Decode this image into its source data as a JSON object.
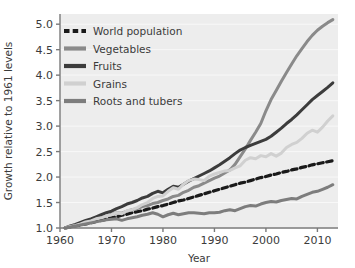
{
  "chart_data": {
    "type": "line",
    "title": "",
    "xlabel": "Year",
    "ylabel": "Growth relative to 1961 levels",
    "xlim": [
      1960,
      2014
    ],
    "ylim": [
      1.0,
      5.2
    ],
    "grid": true,
    "legend_position": "top-left",
    "x_ticks": [
      "1960",
      "1970",
      "1980",
      "1990",
      "2000",
      "2010"
    ],
    "x_tick_values": [
      1960,
      1970,
      1980,
      1990,
      2000,
      2010
    ],
    "y_ticks": [
      "1.0",
      "1.5",
      "2.0",
      "2.5",
      "3.0",
      "3.5",
      "4.0",
      "4.5",
      "5.0"
    ],
    "y_tick_values": [
      1.0,
      1.5,
      2.0,
      2.5,
      3.0,
      3.5,
      4.0,
      4.5,
      5.0
    ],
    "x": [
      1961,
      1962,
      1963,
      1964,
      1965,
      1966,
      1967,
      1968,
      1969,
      1970,
      1971,
      1972,
      1973,
      1974,
      1975,
      1976,
      1977,
      1978,
      1979,
      1980,
      1981,
      1982,
      1983,
      1984,
      1985,
      1986,
      1987,
      1988,
      1989,
      1990,
      1991,
      1992,
      1993,
      1994,
      1995,
      1996,
      1997,
      1998,
      1999,
      2000,
      2001,
      2002,
      2003,
      2004,
      2005,
      2006,
      2007,
      2008,
      2009,
      2010,
      2011,
      2012,
      2013
    ],
    "series": [
      {
        "name": "World population",
        "color": "#1a1a1a",
        "style": "dashed",
        "width": 3.2,
        "values": [
          1.0,
          1.02,
          1.04,
          1.06,
          1.08,
          1.1,
          1.13,
          1.15,
          1.17,
          1.2,
          1.22,
          1.25,
          1.27,
          1.3,
          1.32,
          1.34,
          1.37,
          1.39,
          1.42,
          1.44,
          1.47,
          1.5,
          1.53,
          1.55,
          1.58,
          1.61,
          1.64,
          1.67,
          1.7,
          1.73,
          1.76,
          1.79,
          1.82,
          1.85,
          1.88,
          1.9,
          1.93,
          1.96,
          1.99,
          2.01,
          2.04,
          2.06,
          2.09,
          2.11,
          2.14,
          2.16,
          2.19,
          2.21,
          2.24,
          2.26,
          2.28,
          2.3,
          2.32
        ]
      },
      {
        "name": "Vegetables",
        "color": "#8a8a8a",
        "style": "solid",
        "width": 3.0,
        "values": [
          1.0,
          1.03,
          1.05,
          1.09,
          1.12,
          1.14,
          1.18,
          1.21,
          1.24,
          1.27,
          1.3,
          1.29,
          1.33,
          1.36,
          1.38,
          1.42,
          1.44,
          1.48,
          1.5,
          1.54,
          1.57,
          1.62,
          1.64,
          1.7,
          1.74,
          1.8,
          1.83,
          1.88,
          1.93,
          1.98,
          2.02,
          2.08,
          2.14,
          2.25,
          2.4,
          2.55,
          2.72,
          2.88,
          3.05,
          3.3,
          3.52,
          3.7,
          3.88,
          4.05,
          4.22,
          4.38,
          4.52,
          4.66,
          4.78,
          4.88,
          4.96,
          5.03,
          5.09
        ]
      },
      {
        "name": "Fruits",
        "color": "#3c3c3c",
        "style": "solid",
        "width": 3.0,
        "values": [
          1.0,
          1.04,
          1.07,
          1.11,
          1.15,
          1.18,
          1.22,
          1.26,
          1.3,
          1.33,
          1.38,
          1.42,
          1.47,
          1.5,
          1.54,
          1.59,
          1.62,
          1.68,
          1.72,
          1.69,
          1.76,
          1.82,
          1.8,
          1.86,
          1.92,
          1.97,
          2.02,
          2.07,
          2.12,
          2.18,
          2.24,
          2.31,
          2.38,
          2.46,
          2.53,
          2.58,
          2.62,
          2.66,
          2.7,
          2.74,
          2.8,
          2.88,
          2.96,
          3.05,
          3.13,
          3.22,
          3.32,
          3.42,
          3.52,
          3.6,
          3.68,
          3.76,
          3.85
        ]
      },
      {
        "name": "Grains",
        "color": "#d0d0d0",
        "style": "solid",
        "width": 3.0,
        "values": [
          1.0,
          1.03,
          1.05,
          1.08,
          1.12,
          1.14,
          1.18,
          1.2,
          1.24,
          1.26,
          1.3,
          1.28,
          1.34,
          1.36,
          1.4,
          1.46,
          1.5,
          1.58,
          1.62,
          1.63,
          1.72,
          1.79,
          1.76,
          1.86,
          1.93,
          1.96,
          1.95,
          1.93,
          2.02,
          2.06,
          2.09,
          2.12,
          2.13,
          2.18,
          2.22,
          2.33,
          2.38,
          2.36,
          2.42,
          2.4,
          2.46,
          2.41,
          2.47,
          2.58,
          2.64,
          2.68,
          2.76,
          2.86,
          2.92,
          2.88,
          2.98,
          3.1,
          3.2
        ]
      },
      {
        "name": "Roots and tubers",
        "color": "#7d7d7d",
        "style": "solid",
        "width": 3.0,
        "values": [
          1.0,
          1.02,
          1.04,
          1.06,
          1.08,
          1.1,
          1.12,
          1.14,
          1.16,
          1.17,
          1.18,
          1.15,
          1.18,
          1.2,
          1.22,
          1.25,
          1.27,
          1.3,
          1.27,
          1.22,
          1.26,
          1.29,
          1.26,
          1.28,
          1.3,
          1.3,
          1.29,
          1.28,
          1.3,
          1.3,
          1.31,
          1.34,
          1.36,
          1.34,
          1.38,
          1.42,
          1.44,
          1.43,
          1.47,
          1.5,
          1.52,
          1.51,
          1.54,
          1.56,
          1.58,
          1.57,
          1.62,
          1.66,
          1.7,
          1.72,
          1.76,
          1.8,
          1.85
        ]
      }
    ],
    "legend_entries": [
      {
        "label": "World population",
        "color": "#1a1a1a",
        "style": "dashed"
      },
      {
        "label": "Vegetables",
        "color": "#8a8a8a",
        "style": "solid"
      },
      {
        "label": "Fruits",
        "color": "#3c3c3c",
        "style": "solid"
      },
      {
        "label": "Grains",
        "color": "#d0d0d0",
        "style": "solid"
      },
      {
        "label": "Roots and tubers",
        "color": "#7d7d7d",
        "style": "solid"
      }
    ]
  },
  "style": {
    "plot_background": "#ededed",
    "grid_color": "#f8f8f8",
    "axis_color": "#7a7a7a",
    "text_color": "#3b3b3b",
    "figure_background": "#ffffff"
  }
}
